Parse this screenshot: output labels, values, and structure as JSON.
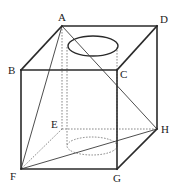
{
  "diagram": {
    "labels": {
      "A": "A",
      "B": "B",
      "C": "C",
      "D": "D",
      "E": "E",
      "F": "F",
      "G": "G",
      "H": "H"
    },
    "vertices": {
      "A": [
        62,
        26
      ],
      "B": [
        21,
        70
      ],
      "C": [
        117,
        70
      ],
      "D": [
        157,
        26
      ],
      "E": [
        62,
        129
      ],
      "F": [
        21,
        169
      ],
      "G": [
        117,
        169
      ],
      "H": [
        157,
        129
      ]
    },
    "solid_edges": [
      "AB",
      "AD",
      "BC",
      "CD",
      "BF",
      "CG",
      "FG",
      "GH",
      "DH"
    ],
    "thin_segments": [
      "AF",
      "AH",
      "FH"
    ],
    "hidden_edges": [
      "AE",
      "EF",
      "EH"
    ],
    "cylinder": {
      "top_ellipse": {
        "cx": 93,
        "cy": 46,
        "rx": 25,
        "ry": 10
      },
      "bottom_ellipse": {
        "cx": 92,
        "cy": 146,
        "rx": 25,
        "ry": 9
      },
      "left_x": 67,
      "right_x": 117
    },
    "colors": {
      "line": "#2a2a2a",
      "hidden_line": "#6a6a6a",
      "background": "#ffffff"
    }
  }
}
